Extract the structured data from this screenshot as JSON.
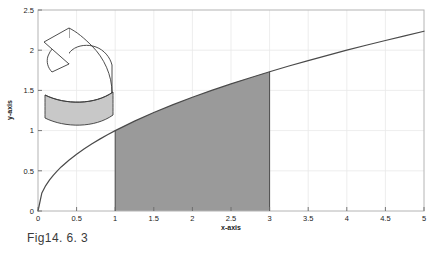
{
  "figure": {
    "caption": "Fig14. 6. 3",
    "background_color": "#ffffff"
  },
  "chart_data": {
    "type": "line",
    "title": "",
    "subtitle": "",
    "xlabel": "x-axis",
    "ylabel": "y-axis",
    "xlim": [
      0,
      5
    ],
    "ylim": [
      0,
      2.5
    ],
    "grid": true,
    "grid_color": "#e8e8e8",
    "legend": null,
    "legend_position": "none",
    "xticks": [
      "0",
      "0.5",
      "1",
      "1.5",
      "2",
      "2.5",
      "3",
      "3.5",
      "4",
      "4.5",
      "5"
    ],
    "xtick_values": [
      0,
      0.5,
      1,
      1.5,
      2,
      2.5,
      3,
      3.5,
      4,
      4.5,
      5
    ],
    "yticks": [
      "0",
      "0.5",
      "1",
      "1.5",
      "2",
      "2.5"
    ],
    "ytick_values": [
      0,
      0.5,
      1,
      1.5,
      2,
      2.5
    ],
    "series": [
      {
        "name": "y = sqrt(x)",
        "color": "#4a4a4a",
        "x": [
          0,
          0.05,
          0.1,
          0.15,
          0.2,
          0.25,
          0.3,
          0.4,
          0.5,
          0.6,
          0.7,
          0.8,
          0.9,
          1,
          1.25,
          1.5,
          1.75,
          2,
          2.25,
          2.5,
          2.75,
          3,
          3.25,
          3.5,
          3.75,
          4,
          4.25,
          4.5,
          4.75,
          5
        ],
        "values": [
          0,
          0.224,
          0.316,
          0.387,
          0.447,
          0.5,
          0.548,
          0.632,
          0.707,
          0.775,
          0.837,
          0.894,
          0.949,
          1,
          1.118,
          1.225,
          1.323,
          1.414,
          1.5,
          1.581,
          1.658,
          1.732,
          1.803,
          1.871,
          1.936,
          2,
          2.062,
          2.121,
          2.179,
          2.236
        ]
      }
    ],
    "shaded_region": {
      "label": "region under curve",
      "x_start": 1,
      "x_end": 3,
      "y_at_start": 1,
      "y_at_end": 1.732,
      "fill_color": "#9a9a9a"
    },
    "annotations": [
      {
        "name": "rotation-arrow",
        "description": "curved rotation arrow",
        "fill_color": "#ffffff",
        "stroke_color": "#3a3a3a"
      },
      {
        "name": "cylinder-shell",
        "description": "shaded cylindrical shell band",
        "fill_color": "#c8c8c8",
        "stroke_color": "#3a3a3a"
      }
    ]
  }
}
